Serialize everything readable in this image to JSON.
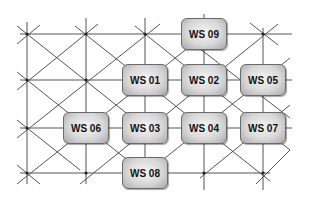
{
  "diagram": {
    "title": "",
    "nodes": [
      {
        "id": "ws09",
        "label": "WS 09",
        "cx": 204,
        "cy": 34
      },
      {
        "id": "ws01",
        "label": "WS 01",
        "cx": 145,
        "cy": 80
      },
      {
        "id": "ws02",
        "label": "WS 02",
        "cx": 204,
        "cy": 80
      },
      {
        "id": "ws05",
        "label": "WS 05",
        "cx": 263,
        "cy": 80
      },
      {
        "id": "ws06",
        "label": "WS 06",
        "cx": 86,
        "cy": 128
      },
      {
        "id": "ws03",
        "label": "WS 03",
        "cx": 145,
        "cy": 128
      },
      {
        "id": "ws04",
        "label": "WS 04",
        "cx": 204,
        "cy": 128
      },
      {
        "id": "ws07",
        "label": "WS 07",
        "cx": 263,
        "cy": 128
      },
      {
        "id": "ws08",
        "label": "WS 08",
        "cx": 145,
        "cy": 173
      }
    ],
    "grid": {
      "columns_x": [
        27,
        86,
        145,
        204,
        263
      ],
      "rows_y": [
        34,
        80,
        128,
        173
      ],
      "line_color": "#555555"
    },
    "colors": {
      "box_fill_center": "#f4f4f4",
      "box_fill_edge": "#a9a9a9",
      "box_border": "#6a6a6a",
      "label_color": "#111111"
    }
  }
}
